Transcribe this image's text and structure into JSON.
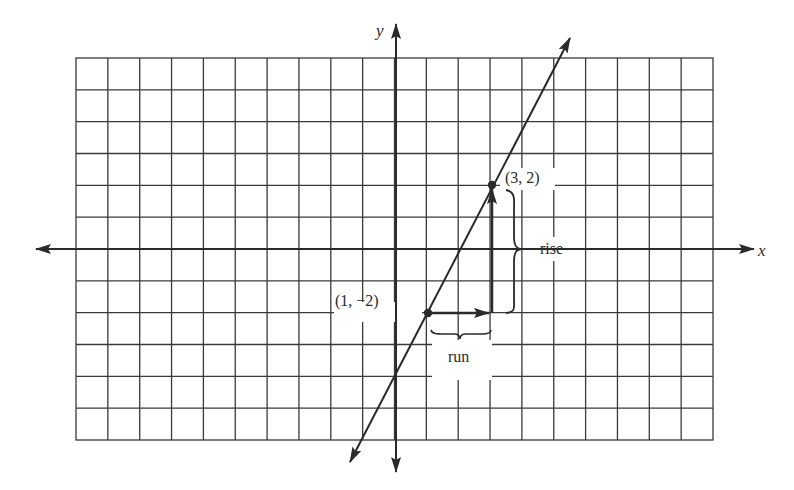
{
  "diagram": {
    "type": "coordinate-plane-slope",
    "grid": {
      "columns": 20,
      "rows": 12,
      "x_min": -10,
      "x_max": 10,
      "y_min": -6,
      "y_max": 6
    },
    "axes": {
      "x_label": "x",
      "y_label": "y"
    },
    "line": {
      "slope": 2,
      "intercept": -4,
      "equation": "y = 2x - 4"
    },
    "points": [
      {
        "label": "(1, −2)",
        "x": 1,
        "y": -2
      },
      {
        "label": "(3, 2)",
        "x": 3,
        "y": 2
      }
    ],
    "annotations": {
      "rise": "rise",
      "run": "run"
    },
    "colors": {
      "ink": "#2a2a2a",
      "background": "#ffffff"
    }
  }
}
